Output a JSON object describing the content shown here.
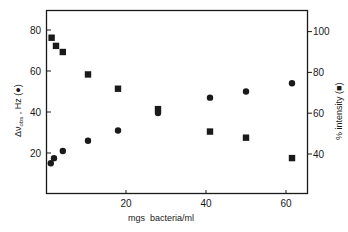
{
  "chart_data": {
    "type": "scatter",
    "title": "",
    "xlabel": "mgs  bacteria/ml",
    "ylabel": "Δν_obs , Hz (●)",
    "ylabel_right": "% intensity (■)",
    "xlim": [
      0,
      65
    ],
    "ylim": [
      0,
      90
    ],
    "ylim_right": [
      20,
      110
    ],
    "x_ticks": [
      20,
      40,
      60
    ],
    "y_ticks": [
      20,
      40,
      60,
      80
    ],
    "y_ticks_right": [
      40,
      60,
      80,
      100
    ],
    "grid": false,
    "legend": "none (markers identified in axis labels)",
    "series": [
      {
        "name": "Δν_obs (Hz)",
        "marker": "circle",
        "axis": "left",
        "x": [
          1.2,
          2,
          4.2,
          10.5,
          18,
          28,
          41,
          50,
          61.5
        ],
        "values": [
          15,
          17.5,
          21,
          26,
          31,
          39.5,
          47,
          50,
          54
        ]
      },
      {
        "name": "% intensity",
        "marker": "square",
        "axis": "right",
        "x": [
          1.4,
          2.5,
          4.2,
          10.5,
          18,
          28,
          41,
          50,
          61.5
        ],
        "values": [
          97,
          93,
          90,
          79,
          72,
          62,
          51,
          48,
          38
        ]
      }
    ]
  },
  "labels": {
    "x_axis_mgs": "mgs",
    "x_axis_rest": "bacteria/ml",
    "y_left_delta": "Δν",
    "y_left_sub": "obs",
    "y_left_rest": " , Hz (●)",
    "y_right": "% intensity (■)"
  },
  "colors": {
    "ink": "#1a1a1a",
    "background": "#ffffff"
  }
}
